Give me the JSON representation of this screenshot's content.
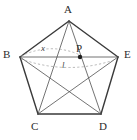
{
  "figure": {
    "shape": "regular-pentagon",
    "stroke_color": "#3a3a3a",
    "diagonal_color": "#4f4f4f",
    "arc_color": "#9a9a9a",
    "background": "#ffffff",
    "vertices": [
      {
        "name": "A",
        "label": "A",
        "x": 69,
        "y": 21,
        "label_x": 65,
        "label_y": 5
      },
      {
        "name": "B",
        "label": "B",
        "x": 20,
        "y": 57,
        "label_x": 4,
        "label_y": 50
      },
      {
        "name": "C",
        "label": "C",
        "x": 38,
        "y": 114,
        "label_x": 31,
        "label_y": 122
      },
      {
        "name": "D",
        "label": "D",
        "x": 101,
        "y": 114,
        "label_x": 100,
        "label_y": 122
      },
      {
        "name": "E",
        "label": "E",
        "x": 118,
        "y": 57,
        "label_x": 124,
        "label_y": 50
      }
    ],
    "point": {
      "name": "P",
      "label": "P",
      "x": 80,
      "y": 57,
      "label_x": 76,
      "label_y": 44,
      "radius": 2.2,
      "on_segment": "BE"
    },
    "segment_labels": [
      {
        "name": "x",
        "label": "x",
        "from": "B",
        "to": "P",
        "label_x": 42,
        "label_y": 45
      },
      {
        "name": "l",
        "label": "l",
        "from": "B",
        "to": "E",
        "label_x": 62,
        "label_y": 62
      }
    ],
    "edges": [
      [
        "A",
        "B"
      ],
      [
        "B",
        "C"
      ],
      [
        "C",
        "D"
      ],
      [
        "D",
        "E"
      ],
      [
        "E",
        "A"
      ]
    ],
    "diagonals": [
      [
        "A",
        "C"
      ],
      [
        "A",
        "D"
      ],
      [
        "B",
        "D"
      ],
      [
        "B",
        "E"
      ],
      [
        "C",
        "E"
      ]
    ],
    "arcs": [
      {
        "name": "arc-x",
        "from": "B",
        "to": "P",
        "style": "dashed",
        "bulge": "up"
      },
      {
        "name": "arc-l",
        "from": "B",
        "to": "E",
        "style": "dashed",
        "bulge": "down"
      }
    ]
  }
}
